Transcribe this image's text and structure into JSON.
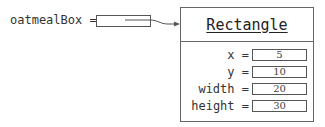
{
  "variable": {
    "name": "oatmealBox",
    "label": "oatmealBox ="
  },
  "object": {
    "class_name": "Rectangle",
    "fields": [
      {
        "name": "x",
        "label": "x =",
        "value": "5"
      },
      {
        "name": "y",
        "label": "y =",
        "value": "10"
      },
      {
        "name": "width",
        "label": "width =",
        "value": "20"
      },
      {
        "name": "height",
        "label": "height =",
        "value": "30"
      }
    ]
  },
  "colors": {
    "stroke": "#555555",
    "text": "#333333",
    "background": "#ffffff"
  }
}
